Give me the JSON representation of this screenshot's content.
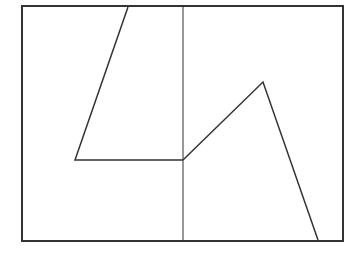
{
  "diagram": {
    "type": "line-drawing",
    "background": "#ffffff",
    "stroke_color": "#333333",
    "frame": {
      "x1": 22,
      "y1": 6,
      "x2": 343,
      "y2": 241,
      "stroke_width": 2
    },
    "divider": {
      "x": 183,
      "y1": 6,
      "y2": 241,
      "stroke_width": 1
    },
    "left_path": {
      "points": "128,7 75,160 183,160",
      "stroke_width": 1.5
    },
    "right_path": {
      "points": "183,160 263,82 318,240",
      "stroke_width": 1.5
    }
  }
}
